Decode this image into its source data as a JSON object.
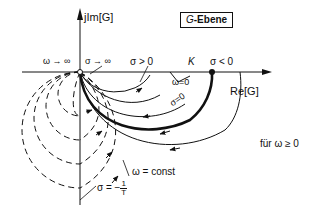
{
  "title": {
    "var": "G",
    "suffix": "-Ebene"
  },
  "axes": {
    "imag_label": "jIm[G]",
    "real_label": "Re[G]"
  },
  "labels": {
    "omega_inf": "ω → ∞",
    "sigma_inf": "σ → ∞",
    "sigma_pos": "σ > 0",
    "K": "K",
    "sigma_neg": "σ < 0",
    "omega_zero": "ω=0",
    "sigma_zero": "σ=0",
    "omega_const": "ω = const",
    "sigma_T_prefix": "σ = −",
    "sigma_T_num": "1",
    "sigma_T_den": "T",
    "condition": "für  ω ≥ 0"
  },
  "colors": {
    "ink": "#111111",
    "background": "#ffffff"
  }
}
